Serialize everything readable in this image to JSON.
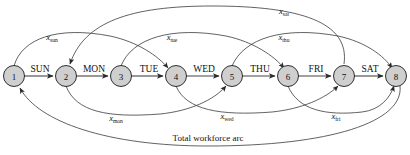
{
  "diagram": {
    "caption": "Total workforce arc",
    "colors": {
      "node_fill": "#cfcfcf",
      "node_stroke": "#1a1a1a",
      "arc_stroke": "#3a3a3a",
      "background": "#ffffff"
    },
    "nodes": [
      {
        "id": "1",
        "label": "1",
        "cx": 14,
        "cy": 76
      },
      {
        "id": "2",
        "label": "2",
        "cx": 66,
        "cy": 76
      },
      {
        "id": "3",
        "label": "3",
        "cx": 121,
        "cy": 76
      },
      {
        "id": "4",
        "label": "4",
        "cx": 176,
        "cy": 76
      },
      {
        "id": "5",
        "label": "5",
        "cx": 232,
        "cy": 76
      },
      {
        "id": "6",
        "label": "6",
        "cx": 288,
        "cy": 76
      },
      {
        "id": "7",
        "label": "7",
        "cx": 344,
        "cy": 76
      },
      {
        "id": "8",
        "label": "8",
        "cx": 396,
        "cy": 76
      }
    ],
    "spine_arcs": [
      {
        "label": "SUN",
        "from": "1",
        "to": "2",
        "x": 40,
        "y": 72
      },
      {
        "label": "MON",
        "from": "2",
        "to": "3",
        "x": 94,
        "y": 72
      },
      {
        "label": "TUE",
        "from": "3",
        "to": "4",
        "x": 149,
        "y": 72
      },
      {
        "label": "WED",
        "from": "4",
        "to": "5",
        "x": 204,
        "y": 72
      },
      {
        "label": "THU",
        "from": "5",
        "to": "6",
        "x": 260,
        "y": 72
      },
      {
        "label": "FRI",
        "from": "6",
        "to": "7",
        "x": 316,
        "y": 72
      },
      {
        "label": "SAT",
        "from": "7",
        "to": "8",
        "x": 370,
        "y": 72
      }
    ],
    "upper_arcs": [
      {
        "var": "x",
        "sub": "sun",
        "from": "1",
        "to": "4",
        "label_x": 52,
        "label_y": 40
      },
      {
        "var": "x",
        "sub": "tue",
        "from": "3",
        "to": "6",
        "label_x": 172,
        "label_y": 40
      },
      {
        "var": "x",
        "sub": "thu",
        "from": "5",
        "to": "8",
        "label_x": 284,
        "label_y": 40
      },
      {
        "var": "x",
        "sub": "sat",
        "from": "7",
        "to": "2",
        "label_x": 284,
        "label_y": 14
      }
    ],
    "lower_arcs": [
      {
        "var": "x",
        "sub": "mon",
        "from": "2",
        "to": "5",
        "label_x": 116,
        "label_y": 119
      },
      {
        "var": "x",
        "sub": "wed",
        "from": "4",
        "to": "7",
        "label_x": 227,
        "label_y": 117
      },
      {
        "var": "x",
        "sub": "fri",
        "from": "6",
        "to": "8",
        "label_x": 336,
        "label_y": 117
      }
    ],
    "total_arc": {
      "from": "8",
      "to": "1",
      "label": "Total workforce arc",
      "label_x": 208,
      "label_y": 141
    }
  }
}
